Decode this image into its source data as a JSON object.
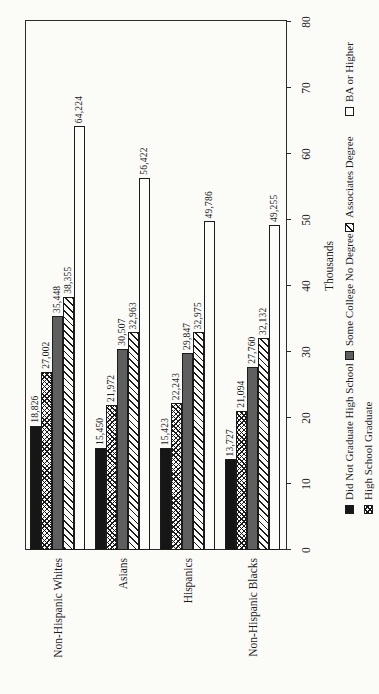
{
  "chart_data": {
    "type": "bar",
    "orientation": "horizontal-bars-page-rotated-90ccw",
    "title": "",
    "xlabel": "Thousands",
    "xlim": [
      0,
      80
    ],
    "ticks": [
      0,
      10,
      20,
      30,
      40,
      50,
      60,
      70,
      80
    ],
    "grid": false,
    "legend_position": "bottom-two-rows",
    "categories": [
      "Non-Hispanic Whites",
      "Asians",
      "Hispanics",
      "Non-Hispanic Blacks"
    ],
    "series": [
      {
        "name": "Did Not Graduate High School",
        "pattern": "black",
        "color": "#161616",
        "values": [
          18826,
          15450,
          15423,
          13727
        ],
        "labels": [
          "18,826",
          "15,450",
          "15,423",
          "13,727"
        ]
      },
      {
        "name": "High School Graduate",
        "pattern": "cross",
        "color": "#fcfcfa",
        "values": [
          27002,
          21972,
          22243,
          21094
        ],
        "labels": [
          "27,002",
          "21,972",
          "22,243",
          "21,094"
        ]
      },
      {
        "name": "Some College No Degree",
        "pattern": "gray",
        "color": "#5f5f5f",
        "values": [
          35448,
          30507,
          29847,
          27760
        ],
        "labels": [
          "35,448",
          "30,507",
          "29,847",
          "27,760"
        ]
      },
      {
        "name": "Associates Degree",
        "pattern": "diag",
        "color": "#fcfcfa",
        "values": [
          38355,
          32963,
          32975,
          32132
        ],
        "labels": [
          "38,355",
          "32,963",
          "32,975",
          "32,132"
        ]
      },
      {
        "name": "BA or Higher",
        "pattern": "white",
        "color": "#fcfcfa",
        "values": [
          64224,
          56422,
          49786,
          49255
        ],
        "labels": [
          "64,224",
          "56,422",
          "49,786",
          "49,255"
        ]
      }
    ],
    "legend_rows": [
      [
        "Did Not Graduate High School",
        "Some College No Degree",
        "Associates Degree",
        "BA or Higher"
      ],
      [
        "High School Graduate"
      ]
    ]
  }
}
